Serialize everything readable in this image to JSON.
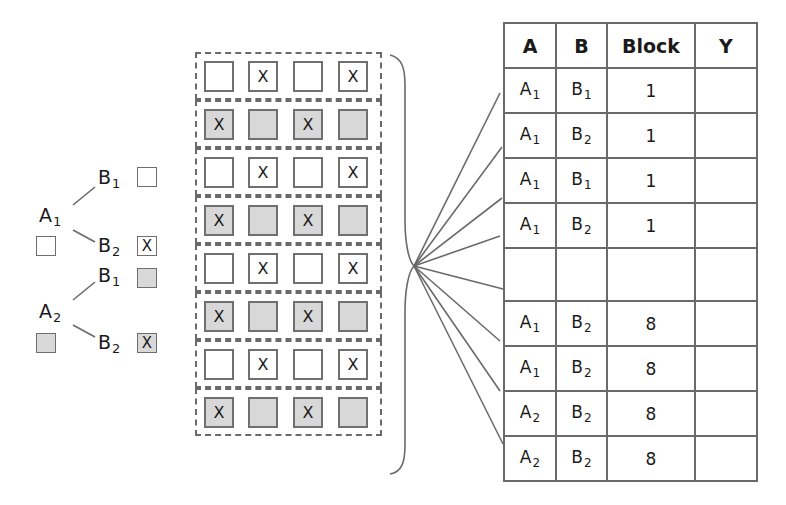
{
  "legend": {
    "tree": [
      {
        "factor": "A",
        "sub": "1",
        "swatch": "white",
        "branches": [
          {
            "factor": "B",
            "sub": "1",
            "swatch": "white",
            "mark": ""
          },
          {
            "factor": "B",
            "sub": "2",
            "swatch": "white",
            "mark": "X"
          }
        ]
      },
      {
        "factor": "A",
        "sub": "2",
        "swatch": "gray",
        "branches": [
          {
            "factor": "B",
            "sub": "1",
            "swatch": "gray",
            "mark": ""
          },
          {
            "factor": "B",
            "sub": "2",
            "swatch": "gray",
            "mark": "X"
          }
        ]
      }
    ]
  },
  "grid": {
    "rows": [
      {
        "fill": "white",
        "marks": [
          "",
          "X",
          "",
          "X"
        ]
      },
      {
        "fill": "gray",
        "marks": [
          "X",
          "",
          "X",
          ""
        ]
      },
      {
        "fill": "white",
        "marks": [
          "",
          "X",
          "",
          "X"
        ]
      },
      {
        "fill": "gray",
        "marks": [
          "X",
          "",
          "X",
          ""
        ]
      },
      {
        "fill": "white",
        "marks": [
          "",
          "X",
          "",
          "X"
        ]
      },
      {
        "fill": "gray",
        "marks": [
          "X",
          "",
          "X",
          ""
        ]
      },
      {
        "fill": "white",
        "marks": [
          "",
          "X",
          "",
          "X"
        ]
      },
      {
        "fill": "gray",
        "marks": [
          "X",
          "",
          "X",
          ""
        ]
      }
    ]
  },
  "table": {
    "headers": [
      "A",
      "B",
      "Block",
      "Y"
    ],
    "rows": [
      {
        "a": "A",
        "a_sub": "1",
        "b": "B",
        "b_sub": "1",
        "block": "1",
        "y": ""
      },
      {
        "a": "A",
        "a_sub": "1",
        "b": "B",
        "b_sub": "2",
        "block": "1",
        "y": ""
      },
      {
        "a": "A",
        "a_sub": "1",
        "b": "B",
        "b_sub": "1",
        "block": "1",
        "y": ""
      },
      {
        "a": "A",
        "a_sub": "1",
        "b": "B",
        "b_sub": "2",
        "block": "1",
        "y": ""
      },
      {
        "a": "",
        "a_sub": "",
        "b": "",
        "b_sub": "",
        "block": "",
        "y": ""
      },
      {
        "a": "A",
        "a_sub": "1",
        "b": "B",
        "b_sub": "2",
        "block": "8",
        "y": ""
      },
      {
        "a": "A",
        "a_sub": "1",
        "b": "B",
        "b_sub": "2",
        "block": "8",
        "y": ""
      },
      {
        "a": "A",
        "a_sub": "2",
        "b": "B",
        "b_sub": "2",
        "block": "8",
        "y": ""
      },
      {
        "a": "A",
        "a_sub": "2",
        "b": "B",
        "b_sub": "2",
        "block": "8",
        "y": ""
      }
    ]
  },
  "colors": {
    "stroke": "#6a6a6a",
    "gray_fill": "#d8d8d8",
    "white_fill": "#ffffff"
  }
}
